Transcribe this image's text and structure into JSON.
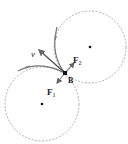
{
  "diagram": {
    "title": "",
    "labels": {
      "velocity": "v",
      "force1": "F",
      "force1_sub": "1",
      "force2": "F",
      "force2_sub": "2",
      "point": "B"
    },
    "elements": {
      "circle_lower": {
        "cx": 42,
        "cy": 104,
        "r": 37,
        "style": "dashed"
      },
      "circle_upper": {
        "cx": 90,
        "cy": 47,
        "r": 36,
        "style": "dashed"
      },
      "center_lower": {
        "x": 42,
        "y": 104
      },
      "center_upper": {
        "x": 90,
        "y": 47
      },
      "point_B": {
        "x": 65,
        "y": 73
      }
    },
    "colors": {
      "stroke": "#555555",
      "dashed": "#999999",
      "arrow": "#777777",
      "text": "#222222"
    }
  }
}
